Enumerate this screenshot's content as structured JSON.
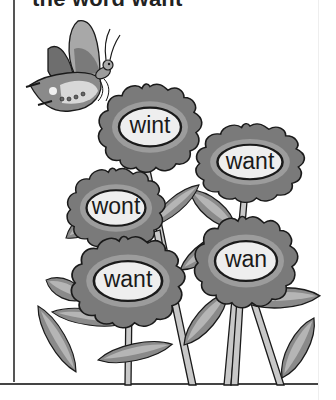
{
  "worksheet": {
    "instruction_partial": "the word want",
    "colors": {
      "petal": "#7a7a7a",
      "petal_inner": "#9c9c9c",
      "leaf_dark": "#8a8a8a",
      "leaf_light": "#b5b5b5",
      "stem": "#c8c8c8",
      "center": "#eeeeee",
      "outline": "#1a1a1a"
    },
    "flowers": [
      {
        "word": "wint"
      },
      {
        "word": "want"
      },
      {
        "word": "wont"
      },
      {
        "word": "want"
      },
      {
        "word": "wan"
      }
    ],
    "decoration": "butterfly-icon"
  }
}
